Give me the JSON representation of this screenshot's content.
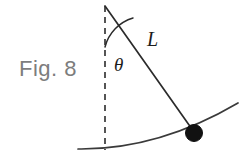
{
  "figure": {
    "caption": "Fig. 8",
    "caption_color": "#7d7d7d",
    "background_color": "#ffffff",
    "stroke_color": "#2b2b2b",
    "bob_color": "#111111",
    "labels": {
      "length": "L",
      "angle": "θ"
    },
    "elements": {
      "pivot_name": "pivot-point",
      "string_name": "pendulum-string",
      "bob_name": "pendulum-bob",
      "vertical_name": "vertical-reference-line",
      "arc_name": "angle-arc",
      "path_name": "swing-path-arc"
    }
  }
}
